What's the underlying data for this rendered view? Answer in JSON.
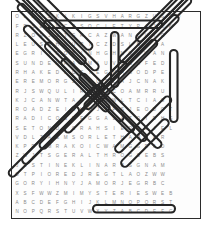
{
  "puzzle": {
    "type": "word-search",
    "title": "Word Search Puzzle",
    "grid_columns": 23,
    "grid_rows": 22,
    "letter_color": "#8a8a8a",
    "oval_color": "#262626",
    "border_color": "#2b2b2b",
    "background_color": "#fdfdfd",
    "rows": [
      "OLDGSKIKIGSVHARGZUSED",
      "FRSEANCESOCIETYPAJOW",
      "RZOEJDTGRCAZWANLUTG",
      "LEUSGHKUPICZDSLBLIA",
      "EGRITROBINHGHNOUWAN",
      "SUNDEMAAOMIUVGNHFED",
      "RHAKEDLCSIEGMAGODPE",
      "EREMORGZVQUTLAJCNAK",
      "RJSWQULIRNHDCOAMRRU",
      "KJCANWTARECBWLTCIAG",
      "ROADZEIGHDJAPSJEODOT",
      "RADICOSEFGGALAZOIDHS",
      "SETONDICRAHSIEOSCIEL",
      "VDLTAEMSORLETHAMTER",
      "KPRLMRAKOICWAMGGRAD",
      "ZWJTSGERALTHROGSEBS",
      "JUSTINEKLINARPSGNAM",
      "OTPIOREDJREGTLAOZWW",
      "GORYIHNYJAMORJEGRBC",
      "XSFWWZMIMYSTERIESWEB",
      "ABCDEFGHIJKLMNOPQRST",
      "NOPQRSTUVWXYZABCDEFG"
    ],
    "found_words": [
      "SEANCE SOCIETY",
      "MYSTERIES",
      "CANDLE",
      "ROBIN",
      "GHOST",
      "SPIRIT",
      "HAUNTED",
      "MEDIUM",
      "PHANTOM",
      "SHADOW",
      "VISION",
      "LEGEND",
      "SECRET",
      "RIDDLE",
      "OCCULT",
      "TRANCE",
      "OMENS",
      "CURSE"
    ]
  }
}
